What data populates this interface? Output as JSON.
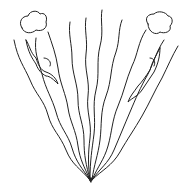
{
  "illustration": {
    "description": "Line drawing of wavy strands converging to a point at the bottom, fanning outward in a V shape, with a cloud at top-left and top-right and figures climbing along the outer strands",
    "stroke_color": "#222222",
    "background_color": "#ffffff",
    "elements": [
      "wavy-strands",
      "left-cloud",
      "right-cloud",
      "left-climbing-figure",
      "right-climbing-figure",
      "convergence-point"
    ]
  }
}
